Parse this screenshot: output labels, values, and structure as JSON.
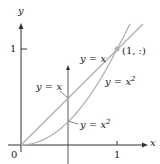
{
  "axes": {
    "x_label": "x",
    "y_label": "y",
    "origin_label": "0",
    "x_tick_label": "1",
    "y_tick_label": "1"
  },
  "curves": [
    {
      "name": "line",
      "equation": "y = x"
    },
    {
      "name": "parabola",
      "equation": "y = x²"
    }
  ],
  "labels": {
    "upper_line": "y = x",
    "upper_parabola": "y = x",
    "upper_parabola_exp": "2",
    "inner_line": "y = x",
    "inner_parabola": "y = x",
    "inner_parabola_exp": "2",
    "intersection": "(1, :)"
  },
  "vertical_line_x": 0.49,
  "colors": {
    "axis": "#333333",
    "curve": "#b0b0b0",
    "point": "#b0b0b0"
  }
}
